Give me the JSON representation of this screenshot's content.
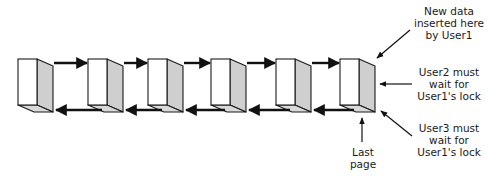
{
  "diagram": {
    "pages": [
      {
        "id": 1,
        "x": 18
      },
      {
        "id": 2,
        "x": 88
      },
      {
        "id": 3,
        "x": 148
      },
      {
        "id": 4,
        "x": 211
      },
      {
        "id": 5,
        "x": 276
      },
      {
        "id": 6,
        "x": 340,
        "is_last": true
      }
    ],
    "colors": {
      "front": "#ffffff",
      "side": "#cfcfcf",
      "bottom": "#d9d9d9",
      "stroke": "#1a1a1a",
      "arrow": "#111111"
    },
    "annotations": {
      "new_data": {
        "lines": [
          "New data",
          "inserted here",
          "by User1"
        ]
      },
      "user2": {
        "lines": [
          "User2 must",
          "wait for",
          "User1's lock"
        ]
      },
      "user3": {
        "lines": [
          "User3 must",
          "wait for",
          "User1's lock"
        ]
      },
      "last_page": {
        "lines": [
          "Last",
          "page"
        ]
      }
    }
  }
}
